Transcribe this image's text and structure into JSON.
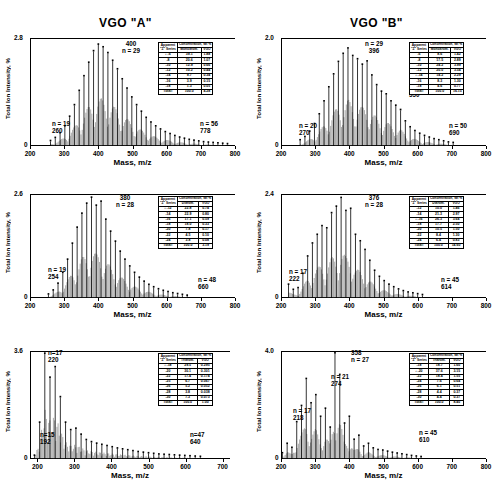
{
  "figure": {
    "column_titles": [
      "VGO \"A\"",
      "VGO \"B\""
    ],
    "axis": {
      "ylabel": "Total Ion Intensity, %",
      "xlabel": "Mass, m/z",
      "yzero": "0"
    },
    "table_headers": {
      "col1_line1": "Apparent",
      "col1_line2": "\"Z\" Series",
      "col2_span": "Concentration, Wt %",
      "total_label": "Total:"
    }
  },
  "panels": [
    {
      "id": "vgo-a-monoaromatic",
      "column": "VGO \"A\"",
      "row": 0,
      "ymax_label": "2.8",
      "xticks": [
        "200",
        "300",
        "400",
        "500",
        "600",
        "700",
        "800"
      ],
      "annotations": [
        {
          "name": "peak-max",
          "lines": [
            "400",
            "n = 29"
          ]
        },
        {
          "name": "low-end",
          "lines": [
            "n = 19",
            "260"
          ]
        },
        {
          "name": "high-end",
          "lines": [
            "n = 56",
            "778"
          ]
        }
      ],
      "table": {
        "type_label": "Monoarom.",
        "vgo_label": "VGO",
        "rows": [
          {
            "z": "-6",
            "type": "39.1",
            "vgo": "1.88",
            "marked": true
          },
          {
            "z": "-8",
            "type": "20.6",
            "vgo": "1.07"
          },
          {
            "z": "-10",
            "type": "12.9",
            "vgo": "0.66"
          },
          {
            "z": "-12",
            "type": "10.2",
            "vgo": "0.44"
          },
          {
            "z": "-14",
            "type": "9.7",
            "vgo": "0.34"
          },
          {
            "z": "-16",
            "type": "3.9",
            "vgo": "0.15"
          },
          {
            "z": "-18",
            "type": "1.3",
            "vgo": "0.05"
          }
        ],
        "total": {
          "type": "100.0",
          "vgo": "4.28"
        }
      },
      "chart_data": {
        "type": "bar",
        "title": "VGO \"A\" Monoaromatics",
        "xlabel": "Mass, m/z",
        "ylabel": "Total Ion Intensity, %",
        "xlim": [
          200,
          800
        ],
        "ylim": [
          0,
          2.8
        ],
        "peak_spacing": 14,
        "x": [
          260,
          274,
          288,
          302,
          316,
          330,
          344,
          358,
          372,
          386,
          400,
          414,
          428,
          442,
          456,
          470,
          484,
          498,
          512,
          526,
          540,
          554,
          568,
          582,
          596,
          610,
          624,
          638,
          652,
          666,
          680,
          694,
          708,
          722,
          736,
          750,
          764,
          778
        ],
        "values": [
          0.12,
          0.2,
          0.32,
          0.5,
          0.75,
          1.05,
          1.42,
          1.8,
          2.15,
          2.45,
          2.62,
          2.55,
          2.4,
          2.2,
          1.98,
          1.72,
          1.48,
          1.25,
          1.05,
          0.88,
          0.72,
          0.6,
          0.5,
          0.42,
          0.35,
          0.3,
          0.25,
          0.21,
          0.18,
          0.15,
          0.13,
          0.11,
          0.09,
          0.08,
          0.07,
          0.06,
          0.05,
          0.04
        ]
      }
    },
    {
      "id": "vgo-b-monoaromatic",
      "column": "VGO \"B\"",
      "row": 0,
      "ymax_label": "2.0",
      "xticks": [
        "200",
        "300",
        "400",
        "500",
        "600",
        "700",
        "800"
      ],
      "annotations": [
        {
          "name": "peak-max",
          "lines": [
            "n = 29",
            "396"
          ]
        },
        {
          "name": "secondary-peak",
          "lines": [
            "n = 40",
            "550"
          ]
        },
        {
          "name": "low-end",
          "lines": [
            "n = 20",
            "270"
          ]
        },
        {
          "name": "high-end",
          "lines": [
            "n = 50",
            "690"
          ]
        }
      ],
      "table": {
        "type_label": "Monoarom.",
        "vgo_label": "VGO",
        "rows": [
          {
            "z": "-6",
            "type": "8.6",
            "vgo": "1.42"
          },
          {
            "z": "-8",
            "type": "17.5",
            "vgo": "2.89"
          },
          {
            "z": "-10",
            "type": "24.2",
            "vgo": "3.99"
          },
          {
            "z": "-12",
            "type": "20.0",
            "vgo": "3.54"
          },
          {
            "z": "-14",
            "type": "14.2",
            "vgo": "2.29",
            "marked": true
          },
          {
            "z": "-16",
            "type": "8.3",
            "vgo": "1.30"
          },
          {
            "z": "-18",
            "type": "4.6",
            "vgo": "0.77"
          }
        ],
        "total": {
          "type": "100.0",
          "vgo": "16.15"
        }
      },
      "chart_data": {
        "type": "bar",
        "title": "VGO \"B\" Monoaromatics",
        "xlabel": "Mass, m/z",
        "ylabel": "Total Ion Intensity, %",
        "xlim": [
          200,
          800
        ],
        "ylim": [
          0,
          2.0
        ],
        "peak_spacing": 14,
        "x": [
          256,
          270,
          284,
          298,
          312,
          326,
          340,
          354,
          368,
          382,
          396,
          410,
          424,
          438,
          452,
          466,
          480,
          494,
          508,
          522,
          536,
          550,
          564,
          578,
          592,
          606,
          620,
          634,
          648,
          662,
          676,
          690,
          704
        ],
        "values": [
          0.1,
          0.16,
          0.26,
          0.4,
          0.58,
          0.82,
          1.08,
          1.32,
          1.55,
          1.7,
          1.8,
          1.66,
          1.6,
          1.5,
          1.56,
          1.3,
          1.12,
          1.0,
          0.95,
          0.82,
          0.74,
          0.66,
          0.45,
          0.34,
          0.27,
          0.22,
          0.18,
          0.15,
          0.12,
          0.1,
          0.08,
          0.06,
          0.05
        ]
      }
    },
    {
      "id": "vgo-a-diaromatic",
      "column": "VGO \"A\"",
      "row": 1,
      "ymax_label": "2.6",
      "xticks": [
        "200",
        "300",
        "400",
        "500",
        "600",
        "700",
        "800"
      ],
      "annotations": [
        {
          "name": "peak-max",
          "lines": [
            "380",
            "n = 28"
          ]
        },
        {
          "name": "low-end",
          "lines": [
            "n = 19",
            "254"
          ]
        },
        {
          "name": "high-end",
          "lines": [
            "n = 48",
            "660"
          ]
        }
      ],
      "table": {
        "type_label": "Diarom.",
        "vgo_label": "VGO",
        "rows": [
          {
            "z": "-12",
            "type": "22.8",
            "vgo": "0.74",
            "marked": true
          },
          {
            "z": "-14",
            "type": "22.9",
            "vgo": "0.80"
          },
          {
            "z": "-16",
            "type": "17.1",
            "vgo": "0.59"
          },
          {
            "z": "-18",
            "type": "18.0",
            "vgo": "0.33"
          },
          {
            "z": "-20",
            "type": "7.8",
            "vgo": "0.17"
          },
          {
            "z": "-22",
            "type": "4.5",
            "vgo": "0.10"
          },
          {
            "z": "-24",
            "type": "3.8",
            "vgo": "0.08"
          }
        ],
        "total": {
          "type": "100.0",
          "vgo": "3.19"
        }
      },
      "chart_data": {
        "type": "bar",
        "title": "VGO \"A\" Diaromatics",
        "xlabel": "Mass, m/z",
        "ylabel": "Total Ion Intensity, %",
        "xlim": [
          200,
          800
        ],
        "ylim": [
          0,
          2.6
        ],
        "peak_spacing": 14,
        "x": [
          254,
          268,
          282,
          296,
          310,
          324,
          338,
          352,
          366,
          380,
          394,
          408,
          422,
          436,
          450,
          464,
          478,
          492,
          506,
          520,
          534,
          548,
          562,
          576,
          590,
          604,
          618,
          632,
          646,
          660
        ],
        "values": [
          0.08,
          0.18,
          0.35,
          0.62,
          0.95,
          1.35,
          1.75,
          2.1,
          2.35,
          2.5,
          2.3,
          2.4,
          1.95,
          1.65,
          1.4,
          1.15,
          0.95,
          0.78,
          0.62,
          0.5,
          0.4,
          0.32,
          0.26,
          0.21,
          0.17,
          0.14,
          0.11,
          0.09,
          0.07,
          0.05
        ]
      }
    },
    {
      "id": "vgo-b-diaromatic",
      "column": "VGO \"B\"",
      "row": 1,
      "ymax_label": "2.4",
      "xticks": [
        "200",
        "300",
        "400",
        "500",
        "600",
        "700",
        "800"
      ],
      "annotations": [
        {
          "name": "peak-max",
          "lines": [
            "376",
            "n = 28"
          ]
        },
        {
          "name": "low-end",
          "lines": [
            "n = 17",
            "222"
          ]
        },
        {
          "name": "high-end",
          "lines": [
            "n = 45",
            "614"
          ]
        }
      ],
      "table": {
        "type_label": "Diarom.",
        "vgo_label": "VGO",
        "rows": [
          {
            "z": "-12",
            "type": "10.0",
            "vgo": "1.46"
          },
          {
            "z": "-14",
            "type": "21.3",
            "vgo": "2.97"
          },
          {
            "z": "-16",
            "type": "26.3",
            "vgo": "3.64",
            "marked": true
          },
          {
            "z": "-18",
            "type": "17.7",
            "vgo": "2.50"
          },
          {
            "z": "-20",
            "type": "10.5",
            "vgo": "1.50"
          },
          {
            "z": "-22",
            "type": "8.4",
            "vgo": "1.30"
          },
          {
            "z": "-24",
            "type": "6.4",
            "vgo": "0.83"
          }
        ],
        "total": {
          "type": "100.0",
          "vgo": "14.60"
        }
      },
      "chart_data": {
        "type": "bar",
        "title": "VGO \"B\" Diaromatics",
        "xlabel": "Mass, m/z",
        "ylabel": "Total Ion Intensity, %",
        "xlim": [
          200,
          800
        ],
        "ylim": [
          0,
          2.4
        ],
        "peak_spacing": 14,
        "x": [
          222,
          236,
          250,
          264,
          278,
          292,
          306,
          320,
          334,
          348,
          362,
          376,
          390,
          404,
          418,
          432,
          446,
          460,
          474,
          488,
          502,
          516,
          530,
          544,
          558,
          572,
          586,
          600,
          614
        ],
        "values": [
          0.3,
          0.18,
          0.22,
          0.55,
          0.95,
          1.25,
          1.45,
          1.65,
          1.6,
          1.95,
          2.1,
          2.3,
          2.0,
          2.05,
          1.45,
          1.3,
          1.1,
          0.85,
          0.62,
          0.48,
          0.38,
          0.3,
          0.24,
          0.19,
          0.15,
          0.12,
          0.1,
          0.08,
          0.06
        ]
      }
    },
    {
      "id": "vgo-a-triaromatic",
      "column": "VGO \"A\"",
      "row": 2,
      "ymax_label": "3.6",
      "xticks": [
        "200",
        "300",
        "400",
        "500",
        "600",
        "700"
      ],
      "annotations": [
        {
          "name": "peak-max",
          "lines": [
            "n=17",
            "220"
          ]
        },
        {
          "name": "low-end",
          "lines": [
            "n=15",
            "192"
          ]
        },
        {
          "name": "high-end",
          "lines": [
            "n=47",
            "640"
          ]
        }
      ],
      "table": {
        "type_label": "Triarom.",
        "vgo_label": "VGO",
        "rows": [
          {
            "z": "-18",
            "type": "29.5",
            "vgo": "0.295",
            "marked": true
          },
          {
            "z": "-20",
            "type": "30.1",
            "vgo": "0.301"
          },
          {
            "z": "-22",
            "type": "17.4",
            "vgo": "0.174"
          },
          {
            "z": "-25",
            "type": "6.7",
            "vgo": "0.067"
          },
          {
            "z": "-26",
            "type": "5.2",
            "vgo": "0.052"
          },
          {
            "z": "-28",
            "type": "3.8",
            "vgo": "0.038"
          },
          {
            "z": "-30",
            "type": "7.3",
            "vgo": "0.073"
          }
        ],
        "total": {
          "type": "100.0",
          "vgo": "1.00"
        }
      },
      "chart_data": {
        "type": "bar",
        "title": "VGO \"A\" Triaromatics",
        "xlabel": "Mass, m/z",
        "ylabel": "Total Ion Intensity, %",
        "xlim": [
          180,
          720
        ],
        "ylim": [
          0,
          3.6
        ],
        "peak_spacing": 14,
        "x": [
          192,
          206,
          220,
          234,
          248,
          262,
          276,
          290,
          304,
          318,
          332,
          346,
          360,
          374,
          388,
          402,
          416,
          430,
          444,
          458,
          472,
          486,
          500,
          514,
          528,
          542,
          556,
          570,
          584,
          598,
          612,
          626,
          640
        ],
        "values": [
          0.1,
          1.2,
          3.5,
          2.7,
          3.05,
          2.05,
          1.2,
          0.95,
          1.0,
          0.8,
          0.62,
          0.55,
          0.5,
          0.46,
          0.42,
          0.38,
          0.34,
          0.31,
          0.28,
          0.25,
          0.22,
          0.2,
          0.18,
          0.16,
          0.14,
          0.13,
          0.12,
          0.11,
          0.1,
          0.09,
          0.08,
          0.07,
          0.06
        ]
      }
    },
    {
      "id": "vgo-b-triaromatic",
      "column": "VGO \"B\"",
      "row": 2,
      "ymax_label": "4.0",
      "xticks": [
        "200",
        "300",
        "400",
        "500",
        "600",
        "700",
        "800"
      ],
      "annotations": [
        {
          "name": "peak-max",
          "lines": [
            "358",
            "n = 27"
          ]
        },
        {
          "name": "mid-peak",
          "lines": [
            "n = 21",
            "274"
          ]
        },
        {
          "name": "low-end",
          "lines": [
            "n = 17",
            "218"
          ]
        },
        {
          "name": "high-end",
          "lines": [
            "n = 45",
            "610"
          ]
        }
      ],
      "table": {
        "type_label": "Triarom.",
        "vgo_label": "VGO",
        "rows": [
          {
            "z": "-18",
            "type": "18.7",
            "vgo": "1.60"
          },
          {
            "z": "-20",
            "type": "37.6",
            "vgo": "3.15",
            "marked": true
          },
          {
            "z": "-22",
            "type": "18.4",
            "vgo": "1.55"
          },
          {
            "z": "-24",
            "type": "7.6",
            "vgo": "0.64"
          },
          {
            "z": "-26",
            "type": "6.1",
            "vgo": "0.51"
          },
          {
            "z": "-28",
            "type": "4.4",
            "vgo": "0.37"
          },
          {
            "z": "-30",
            "type": "4.4",
            "vgo": "0.37"
          }
        ],
        "total": {
          "type": "100.0",
          "vgo": "8.40"
        }
      },
      "chart_data": {
        "type": "bar",
        "title": "VGO \"B\" Triaromatics",
        "xlabel": "Mass, m/z",
        "ylabel": "Total Ion Intensity, %",
        "xlim": [
          200,
          800
        ],
        "ylim": [
          0,
          4.0
        ],
        "peak_spacing": 14,
        "x": [
          204,
          218,
          232,
          246,
          260,
          274,
          288,
          302,
          316,
          330,
          344,
          358,
          372,
          386,
          400,
          414,
          428,
          442,
          456,
          470,
          484,
          498,
          512,
          526,
          540,
          554,
          568,
          582,
          596,
          610
        ],
        "values": [
          0.2,
          0.55,
          0.4,
          1.35,
          1.95,
          2.95,
          2.05,
          2.35,
          1.55,
          1.85,
          1.15,
          3.9,
          3.1,
          1.3,
          1.55,
          0.7,
          0.85,
          0.45,
          0.55,
          0.38,
          0.32,
          0.3,
          0.26,
          0.22,
          0.19,
          0.16,
          0.13,
          0.1,
          0.08,
          0.06
        ]
      }
    }
  ]
}
